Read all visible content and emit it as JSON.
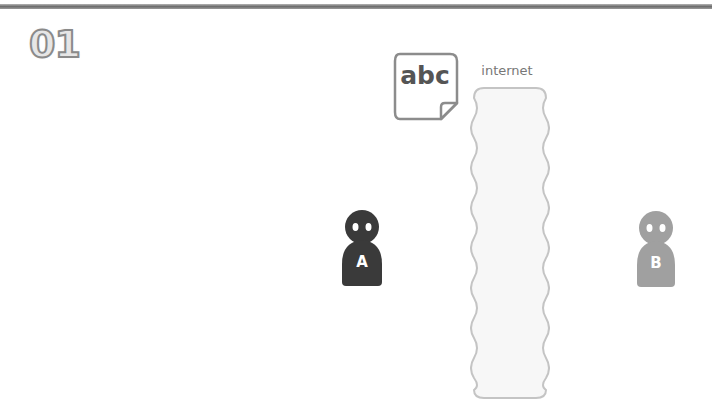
{
  "step": {
    "number": "01"
  },
  "document": {
    "text": "abc",
    "icon": "document-icon"
  },
  "internet": {
    "label": "internet",
    "icon": "cloud-column-icon"
  },
  "persons": [
    {
      "label": "A",
      "color": "#3a3a3a",
      "icon": "person-icon"
    },
    {
      "label": "B",
      "color": "#a0a0a0",
      "icon": "person-icon"
    }
  ],
  "colors": {
    "rule": "#7a7a7a",
    "outline": "#888888",
    "cloud_fill": "#f7f7f7",
    "cloud_stroke": "#c4c4c4"
  }
}
